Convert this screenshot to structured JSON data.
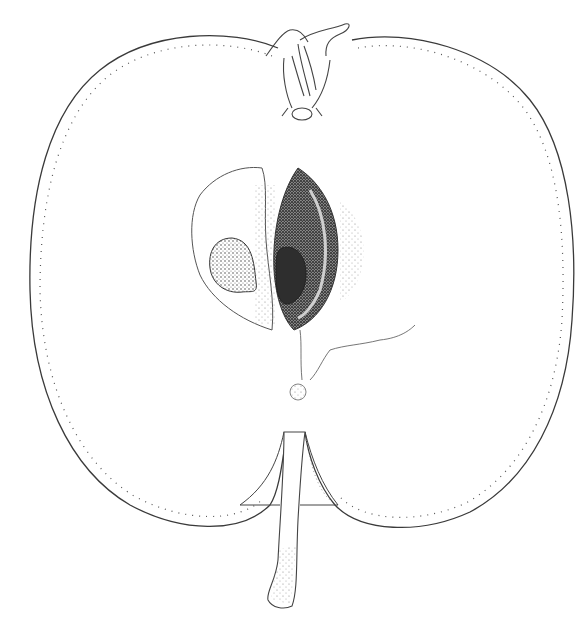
{
  "image": {
    "subject": "Longitudinal cross-section of an apple (botanical line drawing)",
    "style": "pen-and-ink stipple illustration",
    "colors": {
      "background": "#ffffff",
      "ink": "#3a3a3a",
      "seed_dark": "#2a2a2a",
      "stipple": "#6a6a6a"
    },
    "parts": [
      {
        "name": "outer-skin-outline",
        "label": "Apple outline"
      },
      {
        "name": "calyx",
        "label": "Calyx (top)"
      },
      {
        "name": "core-cavity-left",
        "label": "Left carpel cavity"
      },
      {
        "name": "seed-left",
        "label": "Seed (left)"
      },
      {
        "name": "core-cavity-right",
        "label": "Right carpel cavity"
      },
      {
        "name": "seed-right",
        "label": "Seed (right)"
      },
      {
        "name": "vascular-strand",
        "label": "Core vascular line"
      },
      {
        "name": "stem-cavity",
        "label": "Stem cavity"
      },
      {
        "name": "stem",
        "label": "Stem (bottom)"
      }
    ]
  }
}
